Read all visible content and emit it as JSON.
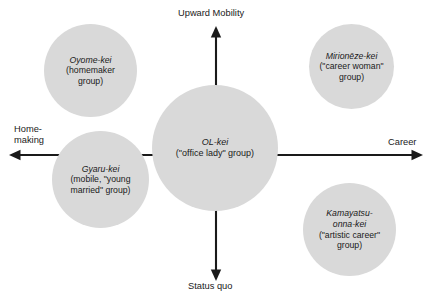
{
  "diagram": {
    "title_visible": false,
    "colors": {
      "bubble_fill": "#d9d9d9",
      "axis": "#1a1a1a",
      "text": "#1a1a1a",
      "background": "#ffffff"
    },
    "axes": {
      "vertical": {
        "top_label": "Upward Mobility",
        "bottom_label": "Status quo"
      },
      "horizontal": {
        "left_label_line1": "Home-",
        "left_label_line2": "making",
        "right_label": "Career"
      }
    },
    "bubbles": [
      {
        "id": "oyome",
        "name_italic": "Oyome-kei",
        "description_line1": "(homemaker",
        "description_line2": "group)",
        "quadrant": "upper-left"
      },
      {
        "id": "mirioneze",
        "name_italic": "Mirionēze-kei",
        "description_line1": "(\"career woman\"",
        "description_line2": "group)",
        "quadrant": "upper-right"
      },
      {
        "id": "ol",
        "name_italic": "OL-kei",
        "description_line1": "(\"office lady\" group)",
        "description_line2": "",
        "quadrant": "center"
      },
      {
        "id": "gyaru",
        "name_italic": "Gyaru-kei",
        "description_line1": "(mobile, \"young",
        "description_line2": "married\" group)",
        "quadrant": "lower-left"
      },
      {
        "id": "kamayatsu",
        "name_italic_line1": "Kamayatsu-",
        "name_italic_line2": "onna-kei",
        "description_line1": "(\"artistic career\"",
        "description_line2": "group)",
        "quadrant": "lower-right"
      }
    ]
  }
}
